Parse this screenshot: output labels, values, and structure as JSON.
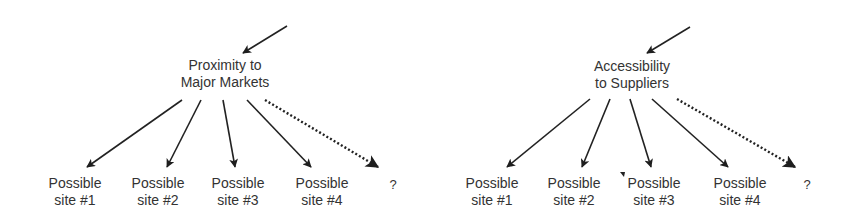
{
  "colors": {
    "ink": "#222222",
    "text": "#333333",
    "background": "#ffffff"
  },
  "diagrams": [
    {
      "factor": {
        "line1": "Proximity to",
        "line2": "Major Markets",
        "x": 225
      },
      "incoming_arrow": {
        "x1": 287,
        "y1": 26,
        "x2": 243,
        "y2": 53
      },
      "branches": [
        {
          "line1": "Possible",
          "line2": "site #1",
          "x": 75,
          "from": [
            182,
            100
          ],
          "to": [
            87,
            167
          ],
          "style": "solid"
        },
        {
          "line1": "Possible",
          "line2": "site #2",
          "x": 158,
          "from": [
            201,
            100
          ],
          "to": [
            167,
            167
          ],
          "style": "solid"
        },
        {
          "line1": "Possible",
          "line2": "site #3",
          "x": 238,
          "from": [
            223,
            100
          ],
          "to": [
            235,
            167
          ],
          "style": "solid"
        },
        {
          "line1": "Possible",
          "line2": "site #4",
          "x": 322,
          "from": [
            247,
            100
          ],
          "to": [
            311,
            167
          ],
          "style": "solid"
        },
        {
          "line1": "?",
          "line2": "",
          "x": 393,
          "from": [
            265,
            100
          ],
          "to": [
            378,
            167
          ],
          "style": "dotted"
        }
      ]
    },
    {
      "factor": {
        "line1": "Accessibility",
        "line2": "to Suppliers",
        "x": 632
      },
      "incoming_arrow": {
        "x1": 690,
        "y1": 27,
        "x2": 647,
        "y2": 53
      },
      "branches": [
        {
          "line1": "Possible",
          "line2": "site #1",
          "x": 492,
          "from": [
            590,
            99
          ],
          "to": [
            507,
            167
          ],
          "style": "solid"
        },
        {
          "line1": "Possible",
          "line2": "site #2",
          "x": 574,
          "from": [
            610,
            99
          ],
          "to": [
            582,
            167
          ],
          "style": "solid"
        },
        {
          "line1": "Possible",
          "line2": "site #3",
          "x": 654,
          "from": [
            630,
            99
          ],
          "to": [
            651,
            167
          ],
          "style": "solid"
        },
        {
          "line1": "Possible",
          "line2": "site #4",
          "x": 740,
          "from": [
            652,
            99
          ],
          "to": [
            728,
            167
          ],
          "style": "solid"
        },
        {
          "line1": "?",
          "line2": "",
          "x": 807,
          "from": [
            677,
            99
          ],
          "to": [
            795,
            167
          ],
          "style": "dotted"
        }
      ]
    }
  ]
}
